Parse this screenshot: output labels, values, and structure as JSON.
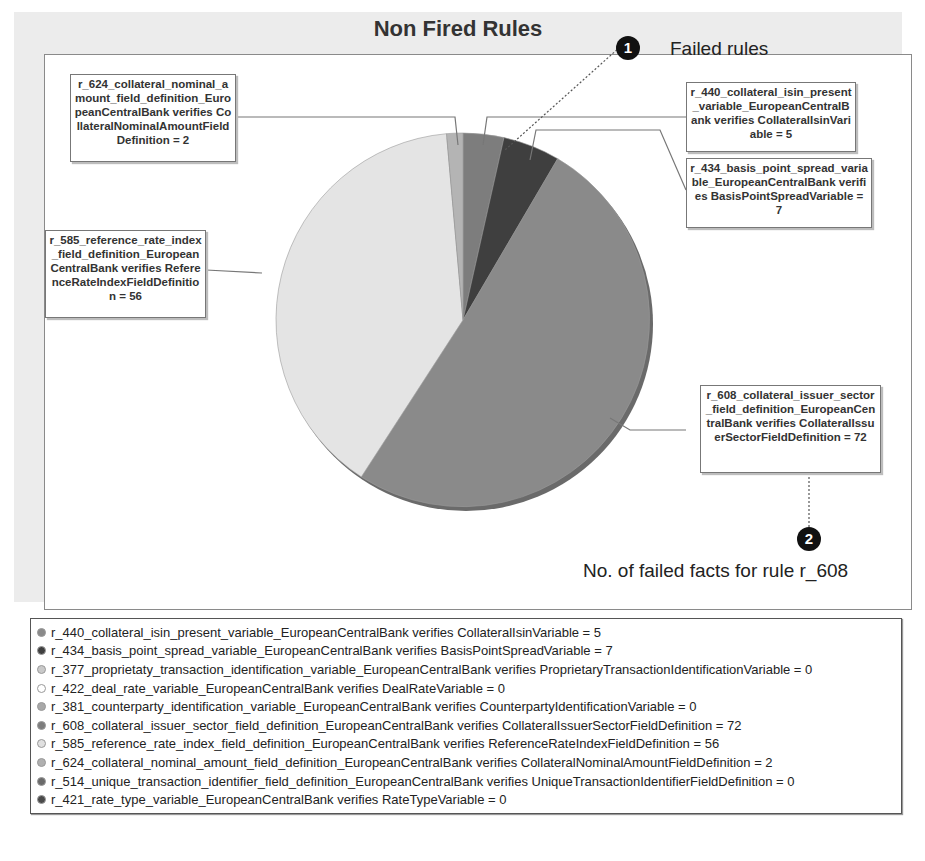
{
  "chart_data": {
    "type": "pie",
    "title": "Non Fired Rules",
    "slices": [
      {
        "rule": "r_440",
        "label": "r_440_collateral_isin_present_variable_EuropeanCentralBank verifies CollateralIsinVariable",
        "value": 5,
        "color": "#7d7d7d"
      },
      {
        "rule": "r_434",
        "label": "r_434_basis_point_spread_variable_EuropeanCentralBank verifies BasisPointSpreadVariable",
        "value": 7,
        "color": "#3f3f3f"
      },
      {
        "rule": "r_608",
        "label": "r_608_collateral_issuer_sector_field_definition_EuropeanCentralBank verifies CollateralIssuerSectorFieldDefinition",
        "value": 72,
        "color": "#8a8a8a"
      },
      {
        "rule": "r_585",
        "label": "r_585_reference_rate_index_field_definition_EuropeanCentralBank verifies ReferenceRateIndexFieldDefinition",
        "value": 56,
        "color": "#e4e4e4"
      },
      {
        "rule": "r_624",
        "label": "r_624_collateral_nominal_amount_field_definition_EuropeanCentralBank verifies CollateralNominalAmountFieldDefinition",
        "value": 2,
        "color": "#b4b4b4"
      }
    ],
    "total": 142,
    "legend_position": "bottom"
  },
  "chart": {
    "title": "Non Fired Rules",
    "callouts": {
      "r624": "r_624_collateral_nominal_amount_field_definition_EuropeanCentralBank verifies CollateralNominalAmountFieldDefinition = 2",
      "r440": "r_440_collateral_isin_present_variable_EuropeanCentralBank verifies CollateralIsinVariable = 5",
      "r434": "r_434_basis_point_spread_variable_EuropeanCentralBank verifies BasisPointSpreadVariable = 7",
      "r585": "r_585_reference_rate_index_field_definition_EuropeanCentralBank verifies ReferenceRateIndexFieldDefinition = 56",
      "r608": "r_608_collateral_issuer_sector_field_definition_EuropeanCentralBank verifies CollateralIssuerSectorFieldDefinition = 72"
    },
    "annotations": {
      "marker1": "1",
      "marker1_text": "Failed rules",
      "marker2": "2",
      "marker2_text": "No. of failed facts for rule r_608"
    }
  },
  "legend": {
    "items": [
      {
        "text": "r_440_collateral_isin_present_variable_EuropeanCentralBank verifies CollateralIsinVariable = 5",
        "color": "#8a8a8a"
      },
      {
        "text": "r_434_basis_point_spread_variable_EuropeanCentralBank verifies BasisPointSpreadVariable = 7",
        "color": "#3f3f3f"
      },
      {
        "text": "r_377_proprietaty_transaction_identification_variable_EuropeanCentralBank verifies ProprietaryTransactionIdentificationVariable = 0",
        "color": "#c9c9c9"
      },
      {
        "text": "r_422_deal_rate_variable_EuropeanCentralBank verifies DealRateVariable = 0",
        "color": "#ffffff"
      },
      {
        "text": "r_381_counterparty_identification_variable_EuropeanCentralBank verifies CounterpartyIdentificationVariable = 0",
        "color": "#a8a8a8"
      },
      {
        "text": "r_608_collateral_issuer_sector_field_definition_EuropeanCentralBank verifies CollateralIssuerSectorFieldDefinition = 72",
        "color": "#7d7d7d"
      },
      {
        "text": "r_585_reference_rate_index_field_definition_EuropeanCentralBank verifies ReferenceRateIndexFieldDefinition = 56",
        "color": "#e0e0e0"
      },
      {
        "text": "r_624_collateral_nominal_amount_field_definition_EuropeanCentralBank verifies CollateralNominalAmountFieldDefinition = 2",
        "color": "#b0b0b0"
      },
      {
        "text": "r_514_unique_transaction_identifier_field_definition_EuropeanCentralBank verifies UniqueTransactionIdentifierFieldDefinition = 0",
        "color": "#6a6a6a"
      },
      {
        "text": "r_421_rate_type_variable_EuropeanCentralBank verifies RateTypeVariable = 0",
        "color": "#4a4a4a"
      }
    ]
  }
}
